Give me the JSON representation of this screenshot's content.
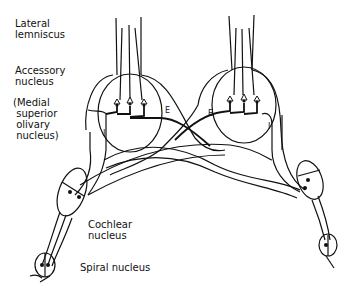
{
  "diagram": {
    "type": "neuroanatomy schematic",
    "labels": {
      "lateral_lemniscus": "Lateral\nlemniscus",
      "accessory_nucleus": "Accessory\nnucleus",
      "mso": "(Medial\n superior\n olivary\n nucleus)",
      "cochlear_nucleus": "Cochlear\nnucleus",
      "spiral_nucleus": "Spiral nucleus"
    },
    "markers": {
      "left_inhibitory": "I",
      "left_excitatory": "E",
      "right_excitatory": "E",
      "right_inhibitory": "I"
    },
    "colors": {
      "ink": "#111111",
      "background": "#ffffff"
    }
  }
}
